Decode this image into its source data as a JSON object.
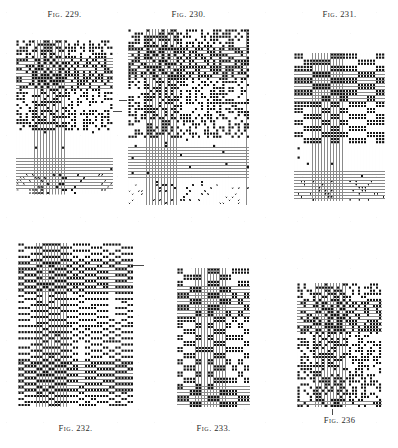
{
  "page": {
    "background_color": "#ffffff",
    "ink_color": "#1a1a1a",
    "cell_fill_color": "#141414",
    "cell_empty_color": "#ffffff",
    "gridline_color": "#8a8a8a"
  },
  "captions": {
    "fig_word": "Fig.",
    "f229": "229.",
    "f230": "230.",
    "f231": "231.",
    "f232": "232.",
    "f233": "233.",
    "f236": "236"
  },
  "figures": [
    {
      "id": "fig-229",
      "label_word": "Fig.",
      "label_number": "229.",
      "caption_position": "top",
      "x": 16,
      "y": 40,
      "width": 97,
      "height": 155,
      "cols": 32,
      "rows": 51,
      "cell": 3.03,
      "seed": 2291,
      "bands": [
        {
          "from_row": 0,
          "to_row": 29,
          "mode": "dense",
          "density": 0.52,
          "mark": "fill"
        },
        {
          "from_row": 30,
          "to_row": 43,
          "mode": "sparse",
          "density": 0.02,
          "mark": "fill"
        },
        {
          "from_row": 44,
          "to_row": 50,
          "mode": "cross",
          "density": 0.22,
          "mark": "cross"
        }
      ]
    },
    {
      "id": "fig-230",
      "label_word": "Fig.",
      "label_number": "230.",
      "caption_position": "top",
      "x": 128,
      "y": 29,
      "width": 121,
      "height": 177,
      "cols": 40,
      "rows": 58,
      "cell": 3.03,
      "seed": 2301,
      "bands": [
        {
          "from_row": 0,
          "to_row": 35,
          "mode": "dense",
          "density": 0.54,
          "mark": "fill"
        },
        {
          "from_row": 36,
          "to_row": 50,
          "mode": "sparse",
          "density": 0.02,
          "mark": "fill"
        },
        {
          "from_row": 51,
          "to_row": 57,
          "mode": "cross",
          "density": 0.2,
          "mark": "cross"
        }
      ]
    },
    {
      "id": "fig-231",
      "label_word": "Fig.",
      "label_number": "231.",
      "caption_position": "top",
      "x": 294,
      "y": 53,
      "width": 91,
      "height": 148,
      "cols": 30,
      "rows": 49,
      "cell": 3.03,
      "seed": 2311,
      "bands": [
        {
          "from_row": 0,
          "to_row": 29,
          "mode": "blocky",
          "density": 0.5,
          "mark": "fill",
          "block_w": 3,
          "block_h": 2
        },
        {
          "from_row": 30,
          "to_row": 41,
          "mode": "sparse",
          "density": 0.015,
          "mark": "fill"
        },
        {
          "from_row": 42,
          "to_row": 48,
          "mode": "cross",
          "density": 0.14,
          "mark": "dot"
        }
      ]
    },
    {
      "id": "fig-232",
      "label_word": "Fig.",
      "label_number": "232.",
      "caption_position": "bottom",
      "x": 18,
      "y": 243,
      "width": 115,
      "height": 164,
      "cols": 38,
      "rows": 54,
      "cell": 3.03,
      "seed": 2321,
      "bands": [
        {
          "from_row": 0,
          "to_row": 53,
          "mode": "blocky",
          "density": 0.48,
          "mark": "fill",
          "block_w": 2,
          "block_h": 1
        }
      ]
    },
    {
      "id": "fig-233",
      "label_word": "Fig.",
      "label_number": "233.",
      "caption_position": "bottom",
      "x": 177,
      "y": 268,
      "width": 73,
      "height": 138,
      "cols": 24,
      "rows": 46,
      "cell": 3.03,
      "seed": 2331,
      "bands": [
        {
          "from_row": 0,
          "to_row": 45,
          "mode": "blocky",
          "density": 0.44,
          "mark": "fill",
          "block_w": 2,
          "block_h": 2
        }
      ]
    },
    {
      "id": "fig-236",
      "label_word": "Fig.",
      "label_number": "236",
      "caption_position": "bottom",
      "x": 297,
      "y": 283,
      "width": 85,
      "height": 125,
      "cols": 28,
      "rows": 41,
      "cell": 3.03,
      "seed": 2361,
      "bands": [
        {
          "from_row": 0,
          "to_row": 40,
          "mode": "dense",
          "density": 0.5,
          "mark": "fill"
        }
      ]
    }
  ],
  "caption_positions": [
    {
      "name": "caption-229",
      "x": 16,
      "y": 9,
      "width": 97,
      "ref": "f229"
    },
    {
      "name": "caption-230",
      "x": 128,
      "y": 9,
      "width": 121,
      "ref": "f230"
    },
    {
      "name": "caption-231",
      "x": 294,
      "y": 9,
      "width": 91,
      "ref": "f231"
    },
    {
      "name": "caption-232",
      "x": 18,
      "y": 423,
      "width": 115,
      "ref": "f232"
    },
    {
      "name": "caption-233",
      "x": 177,
      "y": 423,
      "width": 73,
      "ref": "f233"
    },
    {
      "name": "caption-236",
      "x": 297,
      "y": 415,
      "width": 85,
      "ref": "f236"
    }
  ],
  "tick_marks": [
    {
      "name": "tick-right-of-229",
      "orient": "h",
      "x": 113,
      "y": 111,
      "length": 9
    },
    {
      "name": "tick-left-of-230",
      "orient": "h",
      "x": 119,
      "y": 100,
      "length": 8
    },
    {
      "name": "tick-right-of-232",
      "orient": "h",
      "x": 133,
      "y": 265,
      "length": 11
    },
    {
      "name": "tick-below-236",
      "orient": "v",
      "x": 332,
      "y": 409,
      "length": 6
    }
  ]
}
